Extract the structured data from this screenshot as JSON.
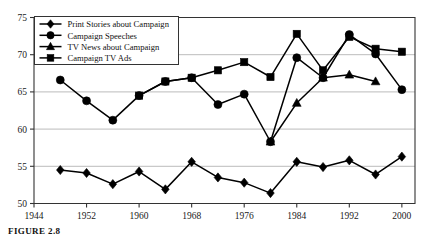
{
  "figure": {
    "caption": "FIGURE 2.8"
  },
  "chart_data": {
    "type": "line",
    "title": "",
    "xlabel": "",
    "ylabel": "",
    "xlim": [
      1944,
      2002
    ],
    "ylim": [
      50,
      75
    ],
    "yticks": [
      50,
      55,
      60,
      65,
      70,
      75
    ],
    "xticks": [
      1944,
      1952,
      1960,
      1968,
      1976,
      1984,
      1992,
      2000
    ],
    "grid": "horizontal",
    "legend_position": "upper-left",
    "marker_color": "#000000",
    "line_color": "#000000",
    "grid_color": "#b4b4b4",
    "axis_color": "#333333",
    "series": [
      {
        "name": "Print Stories about Campaign",
        "marker": "diamond",
        "x": [
          1948,
          1952,
          1956,
          1960,
          1964,
          1968,
          1972,
          1976,
          1980,
          1984,
          1988,
          1992,
          1996,
          2000
        ],
        "values": [
          54.5,
          54.1,
          52.6,
          54.3,
          51.9,
          55.6,
          53.5,
          52.8,
          51.4,
          55.6,
          54.9,
          55.8,
          53.9,
          56.3
        ]
      },
      {
        "name": "Campaign Speeches",
        "marker": "circle",
        "x": [
          1948,
          1952,
          1956,
          1960,
          1964,
          1968,
          1972,
          1976,
          1980,
          1984,
          1988,
          1992,
          1996,
          2000
        ],
        "values": [
          66.6,
          63.8,
          61.2,
          64.5,
          66.4,
          66.9,
          63.3,
          64.7,
          58.3,
          69.6,
          66.9,
          72.7,
          70.1,
          65.3
        ]
      },
      {
        "name": "TV News about Campaign",
        "marker": "triangle",
        "x": [
          1980,
          1984,
          1988,
          1992,
          1996
        ],
        "values": [
          58.3,
          63.5,
          66.9,
          67.3,
          66.4
        ]
      },
      {
        "name": "Campaign TV Ads",
        "marker": "square",
        "x": [
          1960,
          1964,
          1968,
          1972,
          1976,
          1980,
          1984,
          1988,
          1992,
          1996,
          2000
        ],
        "values": [
          64.5,
          66.4,
          66.9,
          67.9,
          69.0,
          67.0,
          72.8,
          67.9,
          72.4,
          70.8,
          70.4
        ]
      }
    ]
  },
  "legend": {
    "items": [
      {
        "label": "Print Stories about Campaign",
        "marker": "diamond"
      },
      {
        "label": "Campaign Speeches",
        "marker": "circle"
      },
      {
        "label": "TV News about Campaign",
        "marker": "triangle"
      },
      {
        "label": "Campaign TV Ads",
        "marker": "square"
      }
    ]
  }
}
